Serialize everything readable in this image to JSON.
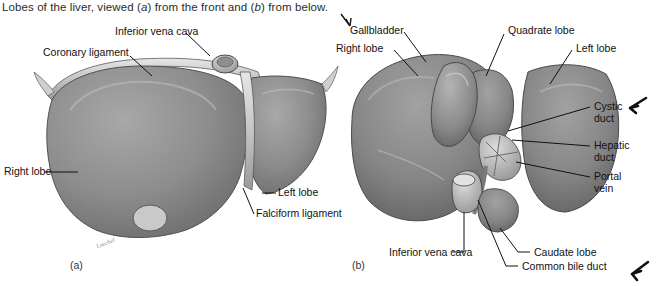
{
  "figure": {
    "caption_pre": "Lobes of the liver, viewed (",
    "caption_a": "a",
    "caption_mid": ") from the front and (",
    "caption_b": "b",
    "caption_post": ") from below.",
    "caption_full": "Lobes of the liver, viewed (a) from the front and (b) from below.",
    "artist_signature": "Loechel",
    "ink_color": "#111111",
    "tissue_mid": "#8f8f8f",
    "tissue_dark": "#6f6f6f",
    "tissue_light": "#b9b9b9",
    "page_background": "#ffffff"
  },
  "panels": [
    {
      "id": "a",
      "id_text": "(a)",
      "view": "anterior view from the front"
    },
    {
      "id": "b",
      "id_text": "(b)",
      "view": "inferior view from below"
    }
  ],
  "labels_panel_a": [
    {
      "text": "Inferior vena cava",
      "structure": "inferior-vena-cava"
    },
    {
      "text": "Coronary ligament",
      "structure": "coronary-ligament"
    },
    {
      "text": "Right lobe",
      "structure": "right-lobe"
    },
    {
      "text": "Left lobe",
      "structure": "left-lobe"
    },
    {
      "text": "Falciform ligament",
      "structure": "falciform-ligament"
    }
  ],
  "labels_panel_b": [
    {
      "text": "Gallbladder",
      "structure": "gallbladder",
      "has_arrow": true
    },
    {
      "text": "Quadrate lobe",
      "structure": "quadrate-lobe",
      "has_arrow": false
    },
    {
      "text": "Right lobe",
      "structure": "right-lobe",
      "has_arrow": false
    },
    {
      "text": "Left lobe",
      "structure": "left-lobe",
      "has_arrow": false
    },
    {
      "text": "Cystic duct",
      "line1": "Cystic",
      "line2": "duct",
      "structure": "cystic-duct",
      "has_arrow": true
    },
    {
      "text": "Hepatic duct",
      "line1": "Hepatic",
      "line2": "duct",
      "structure": "hepatic-duct",
      "has_arrow": false
    },
    {
      "text": "Portal vein",
      "line1": "Portal",
      "line2": "vein",
      "structure": "portal-vein",
      "has_arrow": false
    },
    {
      "text": "Inferior vena cava",
      "structure": "inferior-vena-cava",
      "has_arrow": false
    },
    {
      "text": "Caudate lobe",
      "structure": "caudate-lobe",
      "has_arrow": false
    },
    {
      "text": "Common bile duct",
      "structure": "common-bile-duct",
      "has_arrow": true
    }
  ]
}
